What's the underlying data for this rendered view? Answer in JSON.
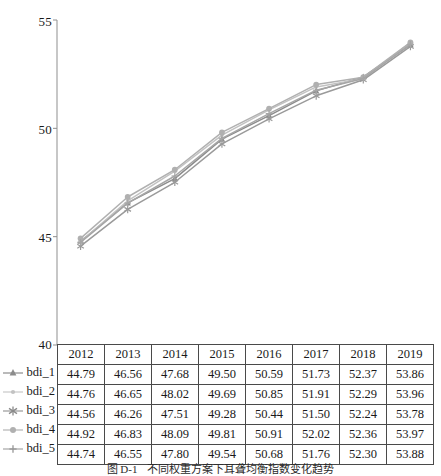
{
  "chart_data": {
    "type": "line",
    "title": "",
    "xlabel": "",
    "ylabel": "",
    "categories": [
      "2012",
      "2013",
      "2014",
      "2015",
      "2016",
      "2017",
      "2018",
      "2019"
    ],
    "ylim": [
      40,
      55
    ],
    "y_ticks": [
      "40",
      "45",
      "50",
      "55"
    ],
    "grid": false,
    "legend_position": "left-of-table",
    "series": [
      {
        "name": "bdi_1",
        "marker": "triangle",
        "color": "#8c8c8c",
        "values": [
          44.79,
          46.56,
          47.68,
          49.5,
          50.59,
          51.73,
          52.37,
          53.86
        ]
      },
      {
        "name": "bdi_2",
        "marker": "dot-small",
        "color": "#c2c2c2",
        "values": [
          44.76,
          46.65,
          48.02,
          49.69,
          50.85,
          51.91,
          52.29,
          53.96
        ]
      },
      {
        "name": "bdi_3",
        "marker": "asterisk",
        "color": "#9a9a9a",
        "values": [
          44.56,
          46.26,
          47.51,
          49.28,
          50.44,
          51.5,
          52.24,
          53.78
        ]
      },
      {
        "name": "bdi_4",
        "marker": "circle",
        "color": "#b0b0b0",
        "values": [
          44.92,
          46.83,
          48.09,
          49.81,
          50.91,
          52.02,
          52.36,
          53.97
        ]
      },
      {
        "name": "bdi_5",
        "marker": "plus",
        "color": "#a6a6a6",
        "values": [
          44.74,
          46.55,
          47.8,
          49.54,
          50.68,
          51.76,
          52.3,
          53.88
        ]
      }
    ]
  },
  "table": {
    "header": [
      "2012",
      "2013",
      "2014",
      "2015",
      "2016",
      "2017",
      "2018",
      "2019"
    ],
    "rows": [
      {
        "label": "bdi_1",
        "cells": [
          "44.79",
          "46.56",
          "47.68",
          "49.50",
          "50.59",
          "51.73",
          "52.37",
          "53.86"
        ]
      },
      {
        "label": "bdi_2",
        "cells": [
          "44.76",
          "46.65",
          "48.02",
          "49.69",
          "50.85",
          "51.91",
          "52.29",
          "53.96"
        ]
      },
      {
        "label": "bdi_3",
        "cells": [
          "44.56",
          "46.26",
          "47.51",
          "49.28",
          "50.44",
          "51.50",
          "52.24",
          "53.78"
        ]
      },
      {
        "label": "bdi_4",
        "cells": [
          "44.92",
          "46.83",
          "48.09",
          "49.81",
          "50.91",
          "52.02",
          "52.36",
          "53.97"
        ]
      },
      {
        "label": "bdi_5",
        "cells": [
          "44.74",
          "46.55",
          "47.80",
          "49.54",
          "50.68",
          "51.76",
          "52.30",
          "53.88"
        ]
      }
    ]
  },
  "axis": {
    "y_labels": [
      "55",
      "50",
      "45",
      "40"
    ]
  },
  "caption": {
    "number": "图 D-1",
    "text": "不同权重方案下耳聋均衡指数变化趋势"
  }
}
